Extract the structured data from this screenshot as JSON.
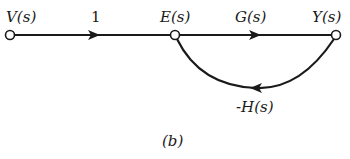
{
  "diagram": {
    "type": "signal-flow-graph",
    "caption": "(b)",
    "nodes": [
      {
        "id": "V",
        "label": "V(s)"
      },
      {
        "id": "E",
        "label": "E(s)"
      },
      {
        "id": "Y",
        "label": "Y(s)"
      }
    ],
    "edges": [
      {
        "from": "V",
        "to": "E",
        "gain": "1"
      },
      {
        "from": "E",
        "to": "Y",
        "gain": "G(s)"
      },
      {
        "from": "Y",
        "to": "E",
        "gain": "-H(s)",
        "style": "feedback-loop"
      }
    ]
  }
}
